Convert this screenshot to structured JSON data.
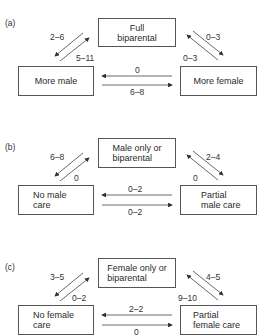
{
  "panels": [
    {
      "label": "(a)",
      "top_box": [
        "Full",
        "biparental"
      ],
      "left_box": [
        "More male"
      ],
      "right_box": [
        "More female"
      ],
      "rates": {
        "top_to_left": "2–6",
        "left_to_top": "5–11",
        "top_to_right": "0–3",
        "right_to_top": "0–3",
        "right_to_left": "0",
        "left_to_right": "6–8"
      }
    },
    {
      "label": "(b)",
      "top_box": [
        "Male only or",
        "biparental"
      ],
      "left_box": [
        "No male",
        "care"
      ],
      "right_box": [
        "Partial",
        "male care"
      ],
      "rates": {
        "top_to_left": "6–8",
        "left_to_top": "0",
        "top_to_right": "2–4",
        "right_to_top": "0",
        "right_to_left": "0–2",
        "left_to_right": "0–2"
      }
    },
    {
      "label": "(c)",
      "top_box": [
        "Female only or",
        "biparental"
      ],
      "left_box": [
        "No female",
        "care"
      ],
      "right_box": [
        "Partial",
        "female care"
      ],
      "rates": {
        "top_to_left": "3–5",
        "left_to_top": "0–2",
        "top_to_right": "4–5",
        "right_to_top": "9–10",
        "right_to_left": "2–2",
        "left_to_right": "0"
      }
    }
  ],
  "colors": {
    "line": "#555555",
    "text": "#2a2a2a"
  }
}
